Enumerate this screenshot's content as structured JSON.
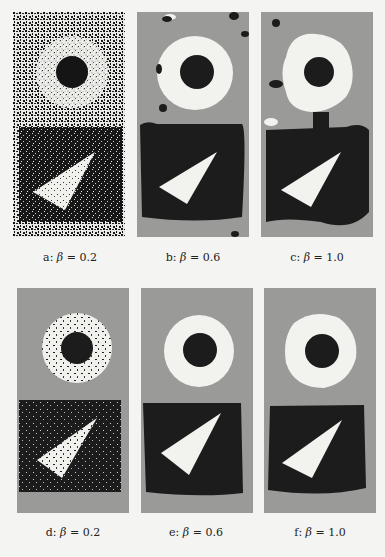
{
  "figure": {
    "rows": [
      {
        "panels": [
          {
            "id": "a",
            "letter": "a:",
            "symbol": "β",
            "eq": "= 0.2",
            "beta": 0.2,
            "style": "noisy-raw"
          },
          {
            "id": "b",
            "letter": "b:",
            "symbol": "β",
            "eq": "= 0.6",
            "beta": 0.6,
            "style": "smooth-artifacts"
          },
          {
            "id": "c",
            "letter": "c:",
            "symbol": "β",
            "eq": "= 1.0",
            "beta": 1.0,
            "style": "oversmooth-merge"
          }
        ]
      },
      {
        "panels": [
          {
            "id": "d",
            "letter": "d:",
            "symbol": "β",
            "eq": "= 0.2",
            "beta": 0.2,
            "style": "speckled"
          },
          {
            "id": "e",
            "letter": "e:",
            "symbol": "β",
            "eq": "= 0.6",
            "beta": 0.6,
            "style": "clean"
          },
          {
            "id": "f",
            "letter": "f:",
            "symbol": "β",
            "eq": "= 1.0",
            "beta": 1.0,
            "style": "clean-rough"
          }
        ]
      }
    ],
    "colors": {
      "background": "#f4f4f2",
      "gray_region": "#9a9a98",
      "dark_region": "#1c1c1c",
      "light_region": "#f2f2ee"
    }
  }
}
